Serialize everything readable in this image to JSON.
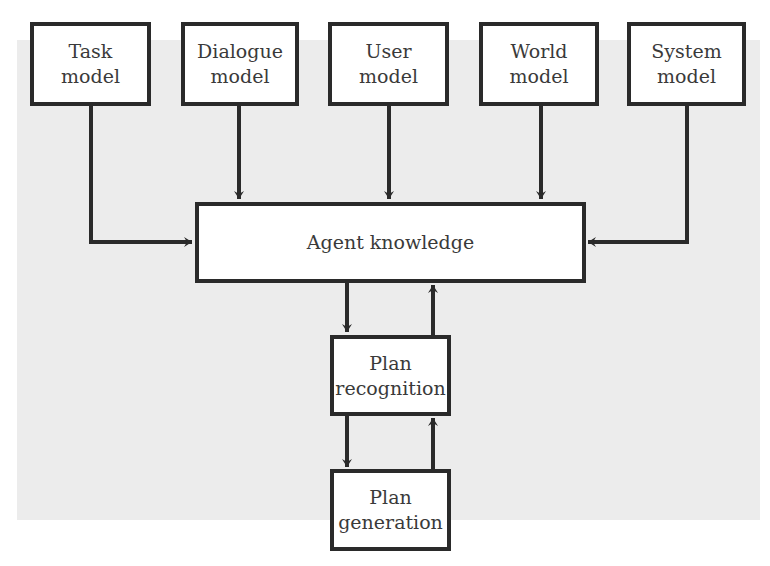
{
  "diagram": {
    "colors": {
      "stroke": "#2a2a2a",
      "box_fill": "#ffffff",
      "background_panel": "#ececec",
      "text": "#3a3a3a"
    },
    "nodes": {
      "task": {
        "line1": "Task",
        "line2": "model"
      },
      "dialogue": {
        "line1": "Dialogue",
        "line2": "model"
      },
      "user": {
        "line1": "User",
        "line2": "model"
      },
      "world": {
        "line1": "World",
        "line2": "model"
      },
      "system": {
        "line1": "System",
        "line2": "model"
      },
      "agent": {
        "label": "Agent knowledge"
      },
      "recognition": {
        "line1": "Plan",
        "line2": "recognition"
      },
      "generation": {
        "line1": "Plan",
        "line2": "generation"
      }
    },
    "edges": [
      {
        "from": "Task model",
        "to": "Agent knowledge"
      },
      {
        "from": "Dialogue model",
        "to": "Agent knowledge"
      },
      {
        "from": "User model",
        "to": "Agent knowledge"
      },
      {
        "from": "World model",
        "to": "Agent knowledge"
      },
      {
        "from": "System model",
        "to": "Agent knowledge"
      },
      {
        "from": "Agent knowledge",
        "to": "Plan recognition"
      },
      {
        "from": "Plan recognition",
        "to": "Agent knowledge"
      },
      {
        "from": "Plan recognition",
        "to": "Plan generation"
      },
      {
        "from": "Plan generation",
        "to": "Plan recognition"
      }
    ]
  }
}
